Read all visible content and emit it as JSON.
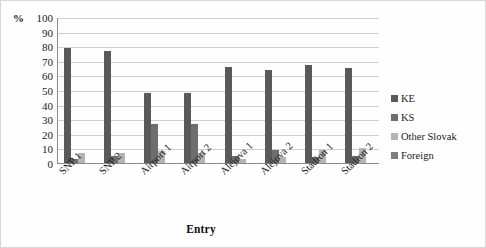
{
  "chart_data": {
    "type": "bar",
    "title": "",
    "xlabel": "Entry",
    "ylabel": "%",
    "ylim": [
      0,
      100
    ],
    "ytick_step": 10,
    "yticks": [
      100,
      90,
      80,
      70,
      60,
      50,
      40,
      30,
      20,
      10,
      0
    ],
    "grid": true,
    "legend_position": "right",
    "categories": [
      "SNP 1",
      "SNP 2",
      "Airport 1",
      "Airport 2",
      "Alejova 1",
      "Alejova 2",
      "Stadion 1",
      "Stadion 2"
    ],
    "series": [
      {
        "name": "KE",
        "color": "#595959",
        "values": [
          79,
          77,
          48,
          48,
          66,
          64,
          67,
          65
        ]
      },
      {
        "name": "KS",
        "color": "#6e6e6e",
        "values": [
          3,
          5,
          27,
          27,
          5,
          9,
          4,
          5
        ]
      },
      {
        "name": "Other Slovak",
        "color": "#b4b4b4",
        "values": [
          7,
          7,
          8,
          7,
          3,
          4,
          9,
          10
        ]
      },
      {
        "name": "Foreign",
        "color": "#7d7d7d",
        "values": [
          0,
          0,
          0,
          0,
          0,
          0,
          0,
          0
        ]
      }
    ]
  },
  "legend": {
    "items": [
      {
        "label": "KE"
      },
      {
        "label": "KS"
      },
      {
        "label": "Other Slovak"
      },
      {
        "label": "Foreign"
      }
    ]
  }
}
